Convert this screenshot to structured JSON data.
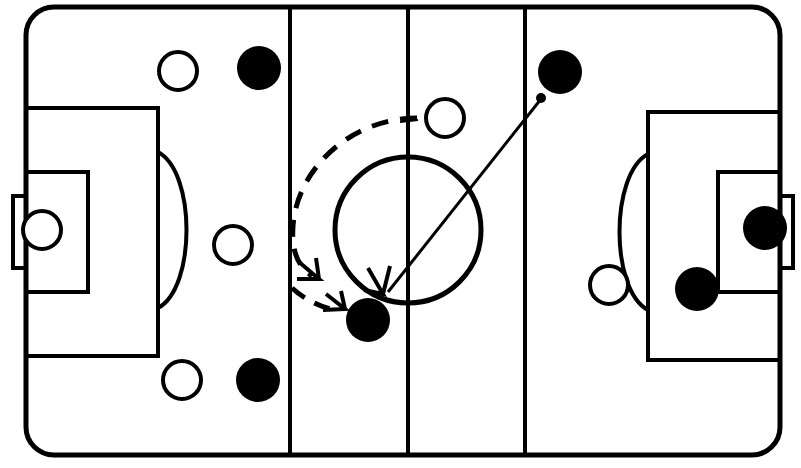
{
  "diagram": {
    "title": "Rink Tactical Diagram",
    "sport": "Floorball / Ice Hockey",
    "view": "full-rink-top-down",
    "width": 801,
    "height": 468,
    "colors": {
      "background": "#ffffff",
      "line": "#000000",
      "team_dark_fill": "#000000",
      "team_light_fill": "#ffffff",
      "ball": "#000000"
    }
  },
  "rink": {
    "name": "rink-outline",
    "x": 26,
    "y": 7,
    "width": 754,
    "height": 448,
    "corner_radius": 28,
    "stroke_width": 5,
    "center_line": {
      "name": "center-line",
      "x": 408,
      "y1": 7,
      "y2": 455
    },
    "lines": [
      {
        "name": "left-restraining-line",
        "x": 290,
        "y1": 7,
        "y2": 455
      },
      {
        "name": "center-line",
        "x": 408,
        "y1": 7,
        "y2": 455
      },
      {
        "name": "right-restraining-line",
        "x": 525,
        "y1": 7,
        "y2": 455
      }
    ],
    "center_circle": {
      "name": "center-circle",
      "cx": 408,
      "cy": 230,
      "r": 73
    },
    "left_goal": {
      "penalty_area": {
        "name": "left-penalty-area",
        "x": 26,
        "y": 108,
        "width": 132,
        "height": 248
      },
      "goal_area": {
        "name": "left-goal-area",
        "x": 26,
        "y": 172,
        "width": 62,
        "height": 120
      },
      "goal_net": {
        "name": "left-goal-net",
        "x": 13,
        "y": 196,
        "width": 26,
        "height": 72
      },
      "goalkeeper": {
        "name": "left-goalkeeper",
        "cx": 42,
        "cy": 230,
        "r": 19,
        "fill": "light"
      },
      "arc": {
        "name": "left-penalty-arc",
        "cx": 158,
        "cy": 230,
        "rx": 38,
        "ry": 78
      }
    },
    "right_goal": {
      "penalty_area": {
        "name": "right-penalty-area",
        "x": 648,
        "y": 112,
        "width": 132,
        "height": 248
      },
      "goal_area": {
        "name": "right-goal-area",
        "x": 718,
        "y": 172,
        "width": 62,
        "height": 120
      },
      "goal_net": {
        "name": "right-goal-net",
        "x": 767,
        "y": 196,
        "width": 26,
        "height": 72
      },
      "arc": {
        "name": "right-penalty-arc",
        "cx": 648,
        "cy": 232,
        "rx": 38,
        "ry": 78
      }
    }
  },
  "players": [
    {
      "id": "p1",
      "name": "player-light-top-left",
      "team": "light",
      "cx": 178,
      "cy": 71,
      "r": 19
    },
    {
      "id": "p2",
      "name": "player-dark-top-left",
      "team": "dark",
      "cx": 259,
      "cy": 68,
      "r": 22
    },
    {
      "id": "p3",
      "name": "player-light-mid-left",
      "team": "light",
      "cx": 233,
      "cy": 245,
      "r": 19
    },
    {
      "id": "p4",
      "name": "player-light-bottom-left",
      "team": "light",
      "cx": 182,
      "cy": 380,
      "r": 19
    },
    {
      "id": "p5",
      "name": "player-dark-bottom-left",
      "team": "dark",
      "cx": 258,
      "cy": 380,
      "r": 22
    },
    {
      "id": "p6",
      "name": "player-light-upper-center",
      "team": "light",
      "cx": 445,
      "cy": 118,
      "r": 19
    },
    {
      "id": "p7",
      "name": "player-dark-passer",
      "team": "dark",
      "cx": 560,
      "cy": 72,
      "r": 22
    },
    {
      "id": "p8",
      "name": "player-dark-receiver",
      "team": "dark",
      "cx": 368,
      "cy": 320,
      "r": 22
    },
    {
      "id": "p9",
      "name": "player-light-mid-right",
      "team": "light",
      "cx": 609,
      "cy": 285,
      "r": 19
    },
    {
      "id": "p10",
      "name": "player-dark-right-inner",
      "team": "dark",
      "cx": 697,
      "cy": 289,
      "r": 22
    },
    {
      "id": "p11",
      "name": "player-dark-right-goal",
      "team": "dark",
      "cx": 765,
      "cy": 228,
      "r": 22
    },
    {
      "id": "p12",
      "name": "goalkeeper-left",
      "team": "light",
      "cx": 42,
      "cy": 230,
      "r": 19
    }
  ],
  "ball": {
    "name": "ball-marker",
    "cx": 541,
    "cy": 98,
    "r": 5
  },
  "movements": [
    {
      "name": "pass-arrow-solid",
      "type": "pass",
      "style": "solid",
      "from": {
        "x": 541,
        "y": 99
      },
      "to": {
        "x": 384,
        "y": 292
      },
      "arrowhead": "single"
    },
    {
      "name": "run-arrow-dashed",
      "type": "run",
      "style": "dashed",
      "path": "M 417 118 C 350 120, 296 170, 294 225 C 292 258, 303 272, 318 278",
      "arrowhead": "double",
      "segment2": "M 300 288 C 312 300, 328 306, 344 309"
    }
  ],
  "legend": {
    "dark_team": "Attacking team",
    "light_team": "Defending team",
    "solid_arrow": "Pass",
    "dashed_arrow": "Player movement",
    "ball": "Ball"
  }
}
